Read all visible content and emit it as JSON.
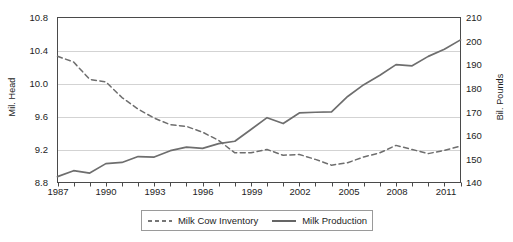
{
  "chart_data": {
    "type": "line",
    "title": "",
    "subtitle": "",
    "xlabel": "",
    "ylabel": "Mil. Head",
    "ylabel_right": "Bil. Pounds",
    "grid": true,
    "legend_position": "bottom",
    "x": [
      1987,
      1988,
      1989,
      1990,
      1991,
      1992,
      1993,
      1994,
      1995,
      1996,
      1997,
      1998,
      1999,
      2000,
      2001,
      2002,
      2003,
      2004,
      2005,
      2006,
      2007,
      2008,
      2009,
      2010,
      2011,
      2012
    ],
    "xticks": [
      "1987",
      "1990",
      "1993",
      "1996",
      "1999",
      "2002",
      "2005",
      "2008",
      "2011"
    ],
    "xlim": [
      1987,
      2012
    ],
    "yticks_left": [
      "8.8",
      "9.2",
      "9.6",
      "10.0",
      "10.4",
      "10.8"
    ],
    "ylim_left": [
      8.8,
      10.8
    ],
    "yticks_right": [
      "140",
      "150",
      "160",
      "170",
      "180",
      "190",
      "200",
      "210"
    ],
    "ylim_right": [
      140,
      210
    ],
    "series": [
      {
        "name": "Milk Cow Inventory",
        "axis": "left",
        "style": "dashed",
        "color": "#6e6e6e",
        "unit": "Mil. Head",
        "values": [
          10.33,
          10.26,
          10.05,
          10.02,
          9.83,
          9.69,
          9.58,
          9.5,
          9.48,
          9.41,
          9.31,
          9.16,
          9.16,
          9.2,
          9.13,
          9.14,
          9.08,
          9.01,
          9.04,
          9.11,
          9.16,
          9.25,
          9.2,
          9.15,
          9.19,
          9.24
        ]
      },
      {
        "name": "Milk Production",
        "axis": "right",
        "style": "solid",
        "color": "#6e6e6e",
        "unit": "Bil. Pounds",
        "values": [
          142.5,
          145.0,
          144.0,
          148.0,
          148.5,
          151.0,
          150.8,
          153.5,
          155.0,
          154.5,
          156.5,
          157.5,
          162.5,
          167.5,
          165.0,
          169.5,
          169.8,
          170.0,
          176.5,
          181.5,
          185.5,
          190.0,
          189.5,
          193.5,
          196.5,
          200.5
        ]
      }
    ]
  },
  "legend": {
    "items": [
      {
        "label": "Milk Cow Inventory",
        "style": "dashed"
      },
      {
        "label": "Milk Production",
        "style": "solid"
      }
    ]
  },
  "colors": {
    "line": "#6e6e6e",
    "axis": "#4a4a4a",
    "grid": "#d3d3d3",
    "text": "#1d1d1d",
    "background": "#ffffff"
  }
}
